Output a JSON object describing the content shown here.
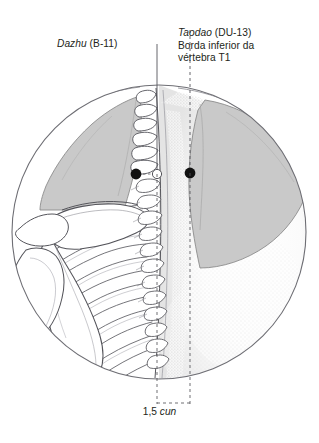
{
  "figure": {
    "type": "anatomical-illustration",
    "view_shape": "circular-vignette",
    "colors": {
      "ink": "#231f20",
      "outline": "#4a4a4a",
      "muscle_fill": "#c9c9c9",
      "muscle_stroke": "#8a8a8a",
      "bone_fill": "#ffffff",
      "bone_stroke": "#55555b",
      "stipple": "#b8b8b8",
      "background": "#ffffff",
      "point_filled": "#111111",
      "point_hollow_fill": "#ffffff"
    }
  },
  "annotations": {
    "dazhu": {
      "term": "Dazhu",
      "code": "(B-11)",
      "leader_style": "solid",
      "point_style": "filled-dot"
    },
    "taodao": {
      "term": "Taodao",
      "code": "(DU-13)",
      "description_line1": "Borda inferior da",
      "description_line2": "vértebra T1",
      "leader_style": "dashed",
      "point_style": "filled-dot"
    },
    "measure": {
      "value": "1,5",
      "unit": "cun",
      "bracket_style": "dashed-rectangle"
    }
  },
  "points": [
    {
      "name": "dazhu-point",
      "marker": "filled",
      "x": 136,
      "y": 174
    },
    {
      "name": "midline-point",
      "marker": "hollow",
      "x": 157,
      "y": 174
    },
    {
      "name": "taodao-point",
      "marker": "filled",
      "x": 190,
      "y": 173
    }
  ],
  "structures": [
    {
      "name": "trapezius-left",
      "fill": "muscle"
    },
    {
      "name": "trapezius-right",
      "fill": "muscle"
    },
    {
      "name": "scapula",
      "fill": "bone"
    },
    {
      "name": "clavicle",
      "fill": "bone"
    },
    {
      "name": "humerus-head",
      "fill": "bone"
    },
    {
      "name": "rib-cage",
      "fill": "bone"
    },
    {
      "name": "vertebral-column",
      "fill": "bone"
    },
    {
      "name": "skin-surface",
      "fill": "stipple"
    }
  ]
}
